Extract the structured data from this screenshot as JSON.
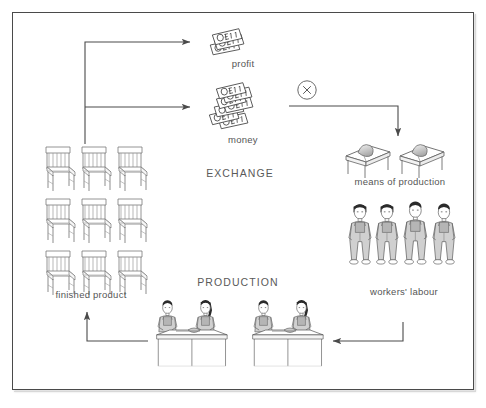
{
  "diagram": {
    "frame": {
      "border_color": "#4a4a4a",
      "background": "#ffffff"
    },
    "text_color": "#555555",
    "labels": {
      "profit": "profit",
      "money": "money",
      "exchange": "EXCHANGE",
      "means_of_production": "means of production",
      "workers_labour": "workers' labour",
      "finished_product": "finished product",
      "production": "PRODUCTION"
    },
    "symbols": {
      "multiply": "×",
      "banknote_value": "£1"
    },
    "nodes": [
      {
        "id": "profit",
        "label": "profit",
        "icon": "banknote-stack-small",
        "count": 3
      },
      {
        "id": "money",
        "label": "money",
        "icon": "banknote-stack-large",
        "count": 7
      },
      {
        "id": "mop",
        "label": "means of production",
        "icon": "workbench-with-material",
        "count": 2
      },
      {
        "id": "workers",
        "label": "workers' labour",
        "icon": "standing-worker",
        "count": 4
      },
      {
        "id": "finished",
        "label": "finished product",
        "icon": "chair",
        "count": 9
      },
      {
        "id": "produce",
        "label": "PRODUCTION",
        "icon": "workbench-with-two-workers",
        "count": 2
      }
    ],
    "arrows": [
      {
        "id": "finished-to-profit",
        "from": "finished product",
        "to": "profit",
        "shape": "up-then-right"
      },
      {
        "id": "finished-to-money",
        "from": "finished product",
        "to": "money",
        "shape": "up-then-right"
      },
      {
        "id": "multiply-to-mop",
        "from": "multiply-symbol",
        "to": "means of production",
        "shape": "right-then-down"
      },
      {
        "id": "workers-to-production",
        "from": "workers' labour",
        "to": "production",
        "shape": "down-then-left"
      },
      {
        "id": "production-to-finished",
        "from": "production",
        "to": "finished product",
        "shape": "left-then-up"
      }
    ]
  }
}
